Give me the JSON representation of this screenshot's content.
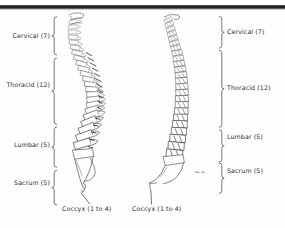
{
  "figure": {
    "views": [
      {
        "name": "lateral-view",
        "side": "left"
      },
      {
        "name": "posterior-view",
        "side": "right"
      }
    ],
    "ink_color": "#1d1d1d",
    "line_color": "#3a3a3a",
    "background_color": "#fefefe",
    "rule_color": "#1b1b1b"
  },
  "left_figure": {
    "regions": [
      {
        "id": "cervical",
        "label": "Cervical (7)"
      },
      {
        "id": "thoracic",
        "label": "Thoracid (12)"
      },
      {
        "id": "lumbar",
        "label": "Lumbar (5)"
      },
      {
        "id": "sacrum",
        "label": "Sacrum (5)"
      }
    ],
    "callout": {
      "id": "coccyx",
      "label": "Coccyx (1 to 4)"
    }
  },
  "right_figure": {
    "regions": [
      {
        "id": "cervical",
        "label": "Cervical (7)"
      },
      {
        "id": "thoracic",
        "label": "Thoracid (12)"
      },
      {
        "id": "lumbar",
        "label": "Lumbar (5)"
      },
      {
        "id": "sacrum",
        "label": "Sacrum (5)"
      }
    ],
    "callout": {
      "id": "coccyx",
      "label": "Coccyx (1 to 4)"
    }
  },
  "vertebra_counts": {
    "cervical": 7,
    "thoracic": 12,
    "lumbar": 5,
    "sacrum": 5,
    "coccyx_min": 1,
    "coccyx_max": 4
  }
}
